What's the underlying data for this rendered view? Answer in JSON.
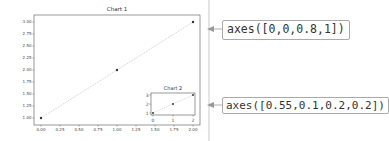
{
  "chart_data": [
    {
      "type": "line",
      "title": "Chart 1",
      "x": [
        0,
        1,
        2
      ],
      "series": [
        {
          "name": "y",
          "values": [
            1,
            2,
            3
          ],
          "marker": "o",
          "linestyle": "dotted"
        }
      ],
      "xlabel": "",
      "ylabel": "",
      "xlim": [
        0,
        2
      ],
      "ylim": [
        1,
        3
      ],
      "xticks": [
        "0.00",
        "0.25",
        "0.50",
        "0.75",
        "1.00",
        "1.25",
        "1.50",
        "1.75",
        "2.00"
      ],
      "yticks": [
        "1.00",
        "1.25",
        "1.50",
        "1.75",
        "2.00",
        "2.25",
        "2.50",
        "2.75",
        "3.00"
      ],
      "grid": false
    },
    {
      "type": "line",
      "title": "Chart 2",
      "x": [
        0,
        1,
        2
      ],
      "series": [
        {
          "name": "y",
          "values": [
            1,
            2,
            3
          ],
          "marker": "o",
          "linestyle": "dotted"
        }
      ],
      "xlabel": "",
      "ylabel": "",
      "xlim": [
        0,
        2
      ],
      "ylim": [
        1,
        3
      ],
      "xticks": [
        "0",
        "1",
        "2"
      ],
      "yticks": [
        "1",
        "2",
        "3"
      ],
      "grid": false
    }
  ],
  "annotations": {
    "main": "axes([0,0,0.8,1])",
    "inset": "axes([0.55,0.1,0.2,0.2])"
  }
}
